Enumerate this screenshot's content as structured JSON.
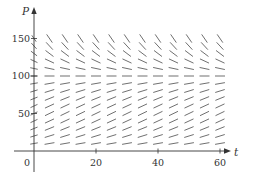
{
  "chart_data": {
    "type": "slope_field",
    "title": "",
    "xlabel": "t",
    "ylabel": "P",
    "xlim": [
      -10,
      68
    ],
    "ylim": [
      -38,
      190
    ],
    "x_ticks": [
      0,
      20,
      40,
      60
    ],
    "y_ticks": [
      50,
      100,
      150
    ],
    "x_tick_labels": [
      "0",
      "20",
      "40",
      "60"
    ],
    "y_tick_labels": [
      "50",
      "100",
      "150"
    ],
    "origin_label": "0",
    "grid": false,
    "legend": null,
    "field": {
      "equation": "dP/dt = k P (1 - P/M)",
      "k": 0.08,
      "M": 100,
      "t_values": [
        0,
        5,
        10,
        15,
        20,
        25,
        30,
        35,
        40,
        45,
        50,
        55,
        60
      ],
      "P_values": [
        10,
        20,
        30,
        40,
        50,
        60,
        70,
        80,
        90,
        100,
        110,
        120,
        130,
        140,
        150
      ],
      "equilibrium_P": 100
    },
    "colors": {
      "axis": "#333333",
      "segments": "#555555",
      "background": "#ffffff"
    }
  }
}
